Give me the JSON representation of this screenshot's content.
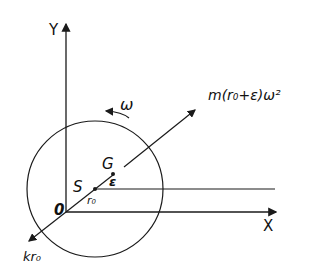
{
  "diagram": {
    "axis_y_label": "Y",
    "axis_x_label": "X",
    "origin_label": "0",
    "point_s_label": "S",
    "point_g_label": "G",
    "epsilon_label": "ε",
    "r0_label": "r₀",
    "omega_label": "ω",
    "force_label": "m(r₀+ε)ω²",
    "spring_label": "kr₀",
    "stroke_color": "#1a1a1a"
  }
}
